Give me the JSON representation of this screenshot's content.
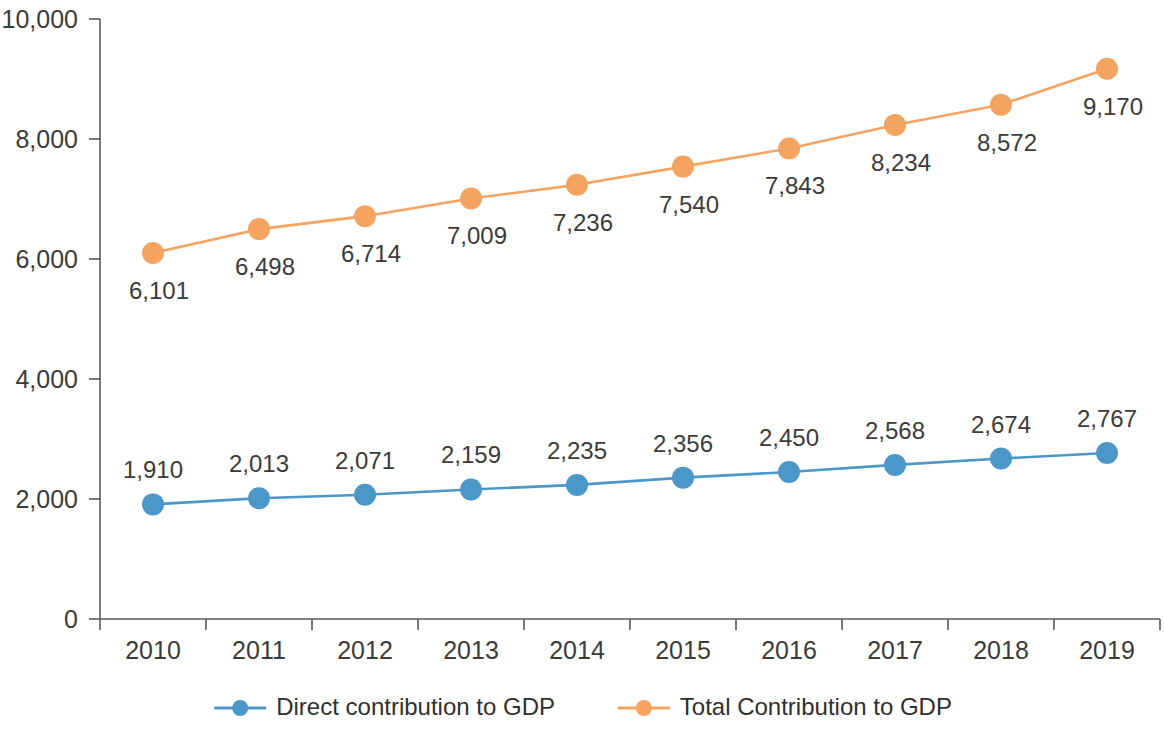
{
  "chart_data": {
    "type": "line",
    "title": "",
    "subtitle": "",
    "xlabel": "",
    "ylabel": "",
    "categories": [
      "2010",
      "2011",
      "2012",
      "2013",
      "2014",
      "2015",
      "2016",
      "2017",
      "2018",
      "2019"
    ],
    "series": [
      {
        "name": "Direct contribution to GDP",
        "color": "#4A97C8",
        "label_position": "above",
        "values": [
          1910,
          2013,
          2071,
          2159,
          2235,
          2356,
          2450,
          2568,
          2674,
          2767
        ],
        "value_labels": [
          "1,910",
          "2,013",
          "2,071",
          "2,159",
          "2,235",
          "2,356",
          "2,450",
          "2,568",
          "2,674",
          "2,767"
        ]
      },
      {
        "name": "Total Contribution to GDP",
        "color": "#F4A460",
        "label_position": "below",
        "values": [
          6101,
          6498,
          6714,
          7009,
          7236,
          7540,
          7843,
          8234,
          8572,
          9170
        ],
        "value_labels": [
          "6,101",
          "6,498",
          "6,714",
          "7,009",
          "7,236",
          "7,540",
          "7,843",
          "8,234",
          "8,572",
          "9,170"
        ]
      }
    ],
    "ylim": [
      0,
      10000
    ],
    "y_ticks": [
      0,
      2000,
      4000,
      6000,
      8000,
      10000
    ],
    "y_tick_labels": [
      "0",
      "2,000",
      "4,000",
      "6,000",
      "8,000",
      "10,000"
    ],
    "grid": false,
    "legend_position": "bottom",
    "legend": [
      {
        "label": "Direct contribution to GDP",
        "color": "#4A97C8"
      },
      {
        "label": "Total Contribution to GDP",
        "color": "#F4A460"
      }
    ],
    "axis_color": "#5a5a5a",
    "background_color": "#ffffff"
  }
}
